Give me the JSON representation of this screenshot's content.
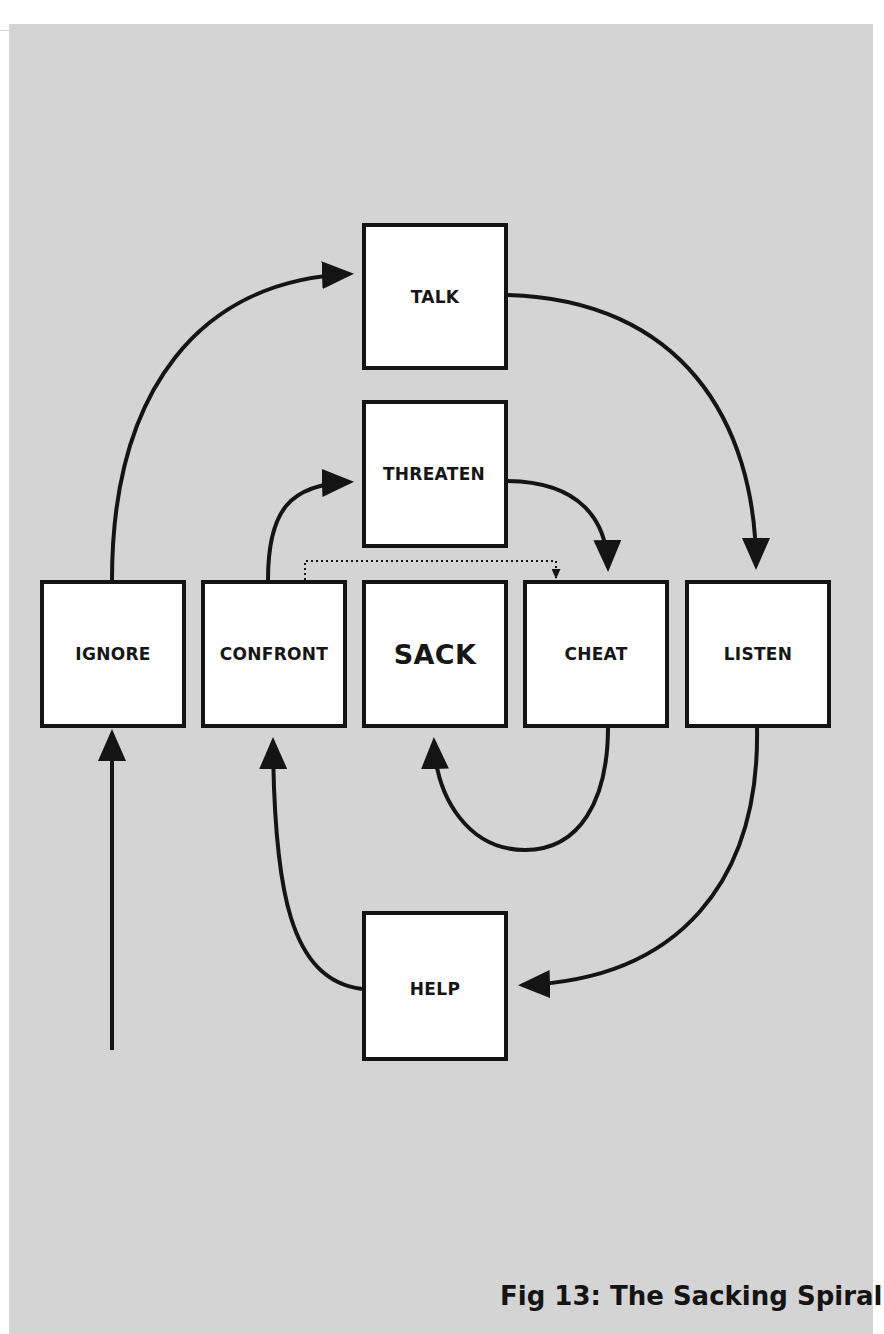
{
  "figure": {
    "caption": "Fig 13: The Sacking Spiral",
    "background_color": "#d4d4d4",
    "box_fill": "#ffffff",
    "line_color": "#141414"
  },
  "nodes": {
    "talk": {
      "label": "TALK"
    },
    "threaten": {
      "label": "THREATEN"
    },
    "ignore": {
      "label": "IGNORE"
    },
    "confront": {
      "label": "CONFRONT"
    },
    "sack": {
      "label": "SACK"
    },
    "cheat": {
      "label": "CHEAT"
    },
    "listen": {
      "label": "LISTEN"
    },
    "help": {
      "label": "HELP"
    }
  },
  "edges": [
    {
      "from": "entry",
      "to": "ignore",
      "style": "solid"
    },
    {
      "from": "ignore",
      "to": "talk",
      "style": "solid"
    },
    {
      "from": "talk",
      "to": "listen",
      "style": "solid"
    },
    {
      "from": "listen",
      "to": "help",
      "style": "solid"
    },
    {
      "from": "help",
      "to": "confront",
      "style": "solid"
    },
    {
      "from": "confront",
      "to": "threaten",
      "style": "solid"
    },
    {
      "from": "threaten",
      "to": "cheat",
      "style": "solid"
    },
    {
      "from": "cheat",
      "to": "sack",
      "style": "solid"
    },
    {
      "from": "confront",
      "to": "cheat",
      "style": "dotted"
    }
  ]
}
